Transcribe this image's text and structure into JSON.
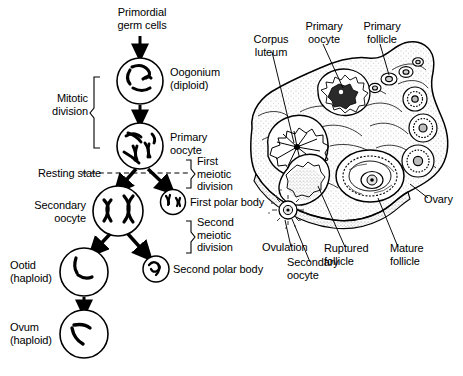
{
  "figure": {
    "ink_color": "#000000",
    "background_color": "#ffffff"
  },
  "flowchart": {
    "title": "Oogenesis flow chart",
    "nodes": {
      "primordial_germ_cells": "Primordial\ngerm cells",
      "oogonium": "Oogonium\n(diploid)",
      "primary_oocyte": "Primary\noocyte",
      "secondary_oocyte": "Secondary\noocyte",
      "first_polar_body": "First polar body",
      "ootid": "Ootid\n(haploid)",
      "second_polar_body": "Second polar body",
      "ovum": "Ovum\n(haploid)"
    },
    "brackets": {
      "mitotic_division": "Mitotic\ndivision",
      "first_meiotic_division": "First\nmeiotic\ndivision",
      "second_meiotic_division": "Second\nmeiotic\ndivision"
    },
    "annotations": {
      "resting_state": "Resting state"
    }
  },
  "ovary": {
    "title": "Ovary cross-section",
    "labels": {
      "corpus_luteum": "Corpus\nluteum",
      "primary_oocyte": "Primary\noocyte",
      "primary_follicle": "Primary\nfollicle",
      "ovary": "Ovary",
      "mature_follicle": "Mature\nfollicle",
      "ruptured_follicle": "Ruptured\nfollicle",
      "secondary_oocyte": "Secondary\noocyte",
      "ovulation": "Ovulation"
    }
  }
}
